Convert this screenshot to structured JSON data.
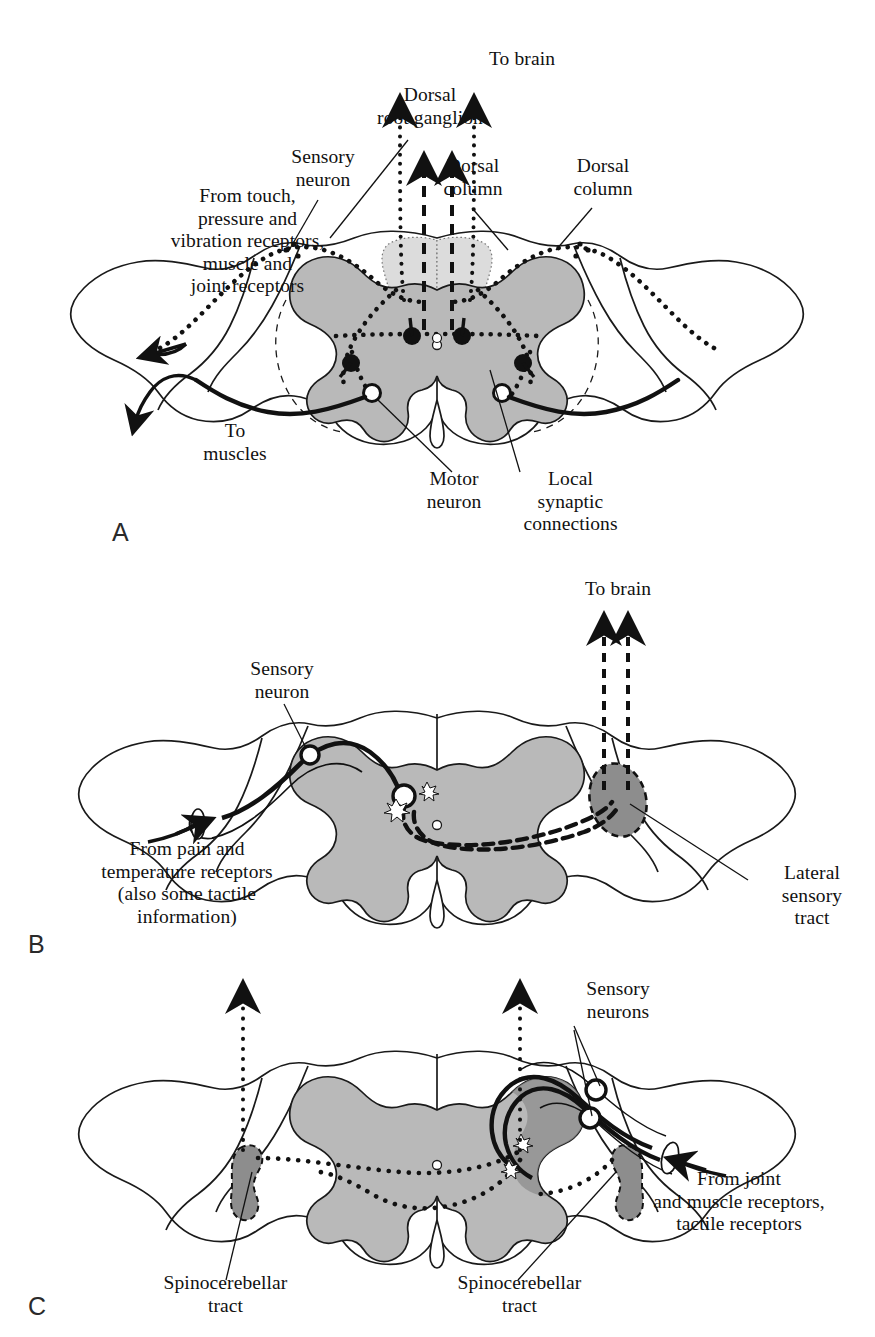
{
  "figure": {
    "colors": {
      "outline": "#1a1a1a",
      "gray_matter": "#b9b9b9",
      "dorsal_column": "#dcdcdc",
      "tract_dark": "#8d8d8d",
      "text": "#111111",
      "background": "#ffffff"
    }
  },
  "panels": [
    {
      "letter": "A",
      "labels": {
        "to_brain": "To brain",
        "dorsal_root_ganglion": "Dorsal\nroot ganglion",
        "sensory_neuron": "Sensory\nneuron",
        "dorsal_column_left": "Dorsal\ncolumn",
        "dorsal_column_right": "Dorsal\ncolumn",
        "from_receptors": "From touch,\npressure and\nvibration receptors,\nmuscle and\njoint receptors",
        "to_muscles": "To\nmuscles",
        "motor_neuron": "Motor\nneuron",
        "local_synaptic_connections": "Local\nsynaptic\nconnections"
      }
    },
    {
      "letter": "B",
      "labels": {
        "to_brain": "To brain",
        "sensory_neuron": "Sensory\nneuron",
        "from_receptors": "From pain and\ntemperature receptors\n(also some tactile\ninformation)",
        "lateral_sensory_tract": "Lateral\nsensory\ntract"
      }
    },
    {
      "letter": "C",
      "labels": {
        "sensory_neurons": "Sensory\nneurons",
        "from_receptors": "From joint\nand muscle receptors,\ntactile receptors",
        "spinocerebellar_tract_left": "Spinocerebellar\ntract",
        "spinocerebellar_tract_right": "Spinocerebellar\ntract"
      }
    }
  ]
}
